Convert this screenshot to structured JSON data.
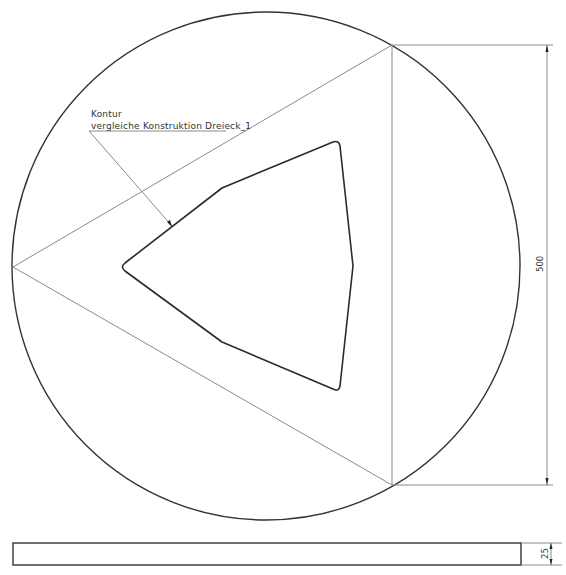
{
  "drawing": {
    "annotation": {
      "line1": "Kontur",
      "line2": "vergleiche Konstruktion Dreieck_1"
    },
    "dimensions": {
      "height_main": "500",
      "thickness": "25"
    },
    "colors": {
      "background": "#ffffff",
      "outline": "#333333",
      "construction_lines": "#8a8a8a"
    },
    "geometry": {
      "circle": {
        "cx": 266,
        "cy": 266,
        "r": 254
      },
      "triangle": [
        [
          13,
          267
        ],
        [
          392,
          45
        ],
        [
          392,
          485
        ]
      ],
      "contour_polygon": [
        [
          122,
          267
        ],
        [
          222,
          188
        ],
        [
          337,
          141
        ],
        [
          353,
          266
        ],
        [
          338,
          390
        ],
        [
          222,
          342
        ]
      ],
      "side_view_rect": {
        "x": 13,
        "y": 543,
        "width": 508,
        "height": 22
      }
    }
  }
}
